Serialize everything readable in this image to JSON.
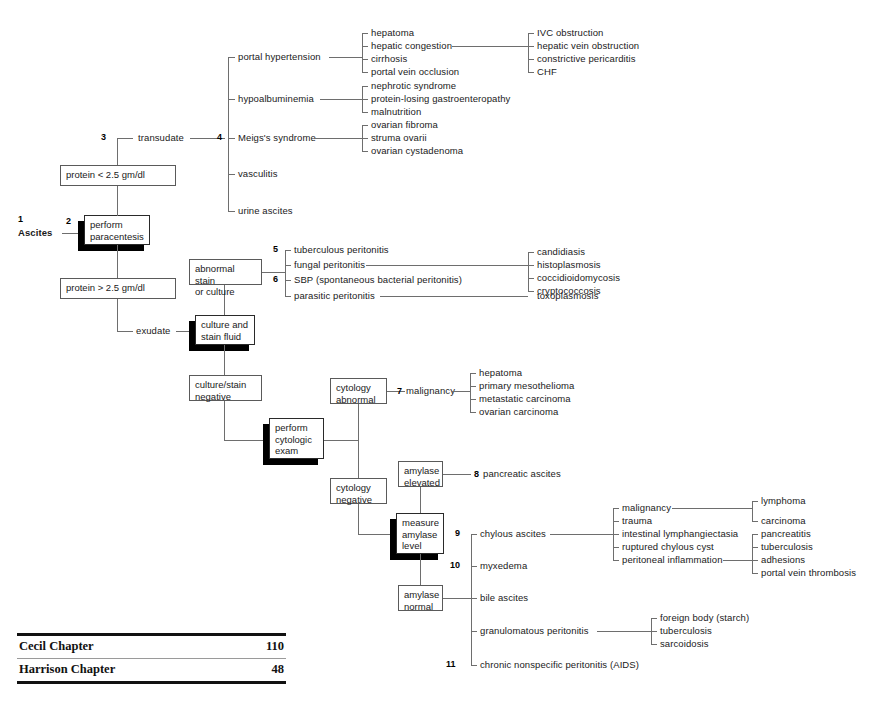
{
  "root": {
    "num": "1",
    "label": "Ascites"
  },
  "nodes": {
    "perform_paracentesis": {
      "num": "2",
      "lines": [
        "perform",
        "paracentesis"
      ]
    },
    "protein_low": {
      "label": "protein < 2.5 gm/dl"
    },
    "protein_high": {
      "label": "protein > 2.5 gm/dl"
    },
    "transudate": {
      "num": "3",
      "label": "transudate"
    },
    "transudate_fan": {
      "num": "4"
    },
    "exudate": {
      "label": "exudate"
    },
    "culture_and_stain_fluid": {
      "lines": [
        "culture and",
        "stain fluid"
      ]
    },
    "abnormal_stain_or_culture": {
      "lines": [
        "abnormal stain",
        "or culture"
      ]
    },
    "culture_stain_negative": {
      "lines": [
        "culture/stain",
        "negative"
      ]
    },
    "perform_cytologic_exam": {
      "lines": [
        "perform",
        "cytologic",
        "exam"
      ]
    },
    "cytology_abnormal": {
      "lines": [
        "cytology",
        "abnormal"
      ]
    },
    "cytology_negative": {
      "lines": [
        "cytology",
        "negative"
      ]
    },
    "measure_amylase_level": {
      "lines": [
        "measure",
        "amylase",
        "level"
      ]
    },
    "amylase_elevated": {
      "lines": [
        "amylase",
        "elevated"
      ]
    },
    "amylase_normal": {
      "lines": [
        "amylase",
        "normal"
      ]
    }
  },
  "transudate_causes": [
    {
      "label": "portal hypertension"
    },
    {
      "label": "hypoalbuminemia"
    },
    {
      "label": "Meigs's syndrome"
    },
    {
      "label": "vasculitis"
    },
    {
      "label": "urine ascites"
    }
  ],
  "portal_hypertension_causes": [
    "hepatoma",
    "hepatic congestion",
    "cirrhosis",
    "portal vein occlusion"
  ],
  "hepatic_congestion_causes": [
    "IVC obstruction",
    "hepatic vein obstruction",
    "constrictive pericarditis",
    "CHF"
  ],
  "hypoalbuminemia_causes": [
    "nephrotic syndrome",
    "protein-losing gastroenteropathy",
    "malnutrition"
  ],
  "meigs_causes": [
    "ovarian fibroma",
    "struma ovarii",
    "ovarian cystadenoma"
  ],
  "abnormal_stain_branches": [
    {
      "num": "5",
      "label": "tuberculous peritonitis"
    },
    {
      "num": "",
      "label": "fungal peritonitis"
    },
    {
      "num": "6",
      "label": "SBP (spontaneous bacterial peritonitis)"
    },
    {
      "num": "",
      "label": "parasitic peritonitis"
    }
  ],
  "fungal_causes": [
    "candidiasis",
    "histoplasmosis",
    "coccidioidomycosis",
    "cryptococcosis"
  ],
  "parasitic_causes": [
    "toxoplasmosis"
  ],
  "malignancy": {
    "num": "7",
    "label": "malignancy"
  },
  "malignancy_causes": [
    "hepatoma",
    "primary mesothelioma",
    "metastatic carcinoma",
    "ovarian carcinoma"
  ],
  "pancreatic_ascites": {
    "num": "8",
    "label": "pancreatic ascites"
  },
  "amylase_normal_branches": [
    {
      "num": "9",
      "label": "chylous ascites"
    },
    {
      "num": "10",
      "label": "myxedema"
    },
    {
      "num": "",
      "label": "bile ascites"
    },
    {
      "num": "",
      "label": "granulomatous peritonitis"
    },
    {
      "num": "11",
      "label": "chronic nonspecific peritonitis (AIDS)"
    }
  ],
  "chylous_causes": [
    "malignancy",
    "trauma",
    "intestinal lymphangiectasia",
    "ruptured chylous cyst",
    "peritoneal inflammation"
  ],
  "chylous_malignancy_causes": [
    "lymphoma",
    "carcinoma"
  ],
  "peritoneal_inflammation_causes": [
    "pancreatitis",
    "tuberculosis",
    "adhesions",
    "portal vein thrombosis"
  ],
  "granulomatous_causes": [
    "foreign body (starch)",
    "tuberculosis",
    "sarcoidosis"
  ],
  "reference_table": {
    "rows": [
      {
        "name": "Cecil Chapter",
        "value": "110"
      },
      {
        "name": "Harrison Chapter",
        "value": "48"
      }
    ]
  },
  "colors": {
    "line": "#6e6e6e",
    "text": "#1a1a1a",
    "shadow": "#000000",
    "rule": "#111111"
  }
}
